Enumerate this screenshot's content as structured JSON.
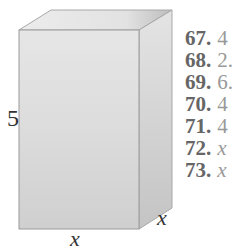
{
  "figure": {
    "type": "rectangular box (prism)",
    "labels": {
      "height": "5",
      "width": "x",
      "depth": "x"
    },
    "colors": {
      "front_face": "#d6d6d6",
      "top_face": "#e2e2e2",
      "side_face": "#c8c8c8",
      "edge": "#9a9a9a"
    }
  },
  "exercises": [
    {
      "number": "67.",
      "text": "4"
    },
    {
      "number": "68.",
      "text": "2."
    },
    {
      "number": "69.",
      "text": "6."
    },
    {
      "number": "70.",
      "text": "4"
    },
    {
      "number": "71.",
      "text": "4"
    },
    {
      "number": "72.",
      "text": "x",
      "italic": true
    },
    {
      "number": "73.",
      "text": "x",
      "italic": true
    }
  ]
}
